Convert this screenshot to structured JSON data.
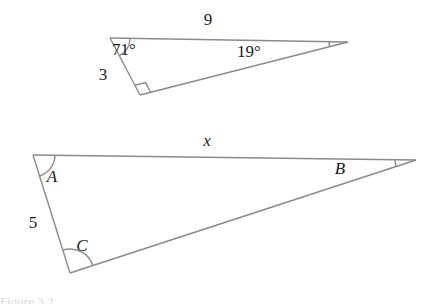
{
  "figure": {
    "title": "Two similar triangles with labeled sides and angles",
    "stroke_color": "#8a8a8a",
    "text_color": "#1a1a1a",
    "background": "#ffffff",
    "stroke_width": 1.4,
    "upper_triangle": {
      "name": "upper-triangle",
      "vertices": {
        "top_left": {
          "x": 110,
          "y": 38
        },
        "right_apex": {
          "x": 348,
          "y": 42
        },
        "bottom": {
          "x": 140,
          "y": 95
        }
      },
      "labels": {
        "top_side": "9",
        "left_side": "3",
        "angle_top_left": "71°",
        "angle_right": "19°"
      },
      "label_positions": {
        "top_side": {
          "x": 208,
          "y": 25
        },
        "left_side": {
          "x": 103,
          "y": 80
        },
        "angle_top_left": {
          "x": 124,
          "y": 55
        },
        "angle_right": {
          "x": 249,
          "y": 57
        }
      },
      "right_angle_vertex": "bottom"
    },
    "lower_triangle": {
      "name": "lower-triangle",
      "vertices": {
        "top_left": {
          "x": 33,
          "y": 155
        },
        "right_apex": {
          "x": 416,
          "y": 160
        },
        "bottom": {
          "x": 70,
          "y": 273
        }
      },
      "labels": {
        "top_side": "x",
        "left_side": "5",
        "angle_top_left": "A",
        "angle_right": "B",
        "angle_bottom": "C"
      },
      "label_positions": {
        "top_side": {
          "x": 207,
          "y": 146
        },
        "left_side": {
          "x": 33,
          "y": 228
        },
        "angle_top_left": {
          "x": 52,
          "y": 182
        },
        "angle_right": {
          "x": 340,
          "y": 174
        },
        "angle_bottom": {
          "x": 82,
          "y": 251
        }
      }
    },
    "caption_fragment": "Figure 3.2"
  }
}
